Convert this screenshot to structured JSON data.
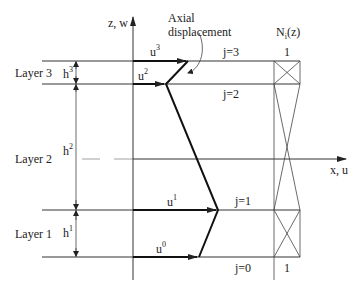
{
  "axes": {
    "vertical_label": "z, w",
    "horizontal_label": "x, u"
  },
  "annotation": {
    "line1": "Axial",
    "line2": "displacement"
  },
  "shape_function": {
    "label_main": "N",
    "label_sub": "i",
    "label_arg": "(z)",
    "top_value": "1",
    "bottom_value": "1"
  },
  "layers": [
    {
      "name": "Layer 3",
      "h_base": "h",
      "h_sup": "3"
    },
    {
      "name": "Layer 2",
      "h_base": "h",
      "h_sup": "2"
    },
    {
      "name": "Layer 1",
      "h_base": "h",
      "h_sup": "1"
    }
  ],
  "interfaces": [
    {
      "label": "j=3",
      "u_base": "u",
      "u_sup": "3"
    },
    {
      "label": "j=2",
      "u_base": "u",
      "u_sup": "2"
    },
    {
      "label": "j=1",
      "u_base": "u",
      "u_sup": "1"
    },
    {
      "label": "j=0",
      "u_base": "u",
      "u_sup": "0"
    }
  ]
}
